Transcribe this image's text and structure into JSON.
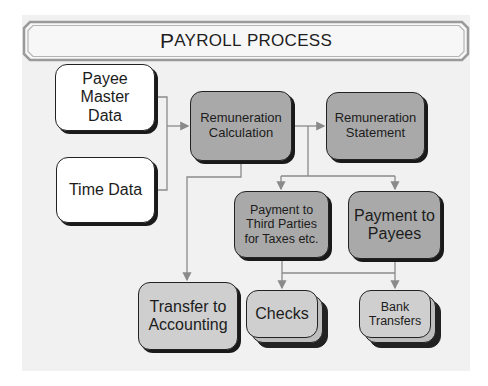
{
  "title_parts": {
    "first_cap": "P",
    "rest_first": "AYROLL",
    "word2": "PROCESS"
  },
  "colors": {
    "slide_bg": "#f1f1f1",
    "input_fill": "#ffffff",
    "process_fill": "#a9a9a9",
    "output_fill": "#cfcfcf",
    "border": "#222222",
    "connector": "#8a8a8a"
  },
  "nodes": {
    "payee_master_data": {
      "label": "Payee Master Data",
      "lines": [
        "Payee",
        "Master",
        "Data"
      ]
    },
    "time_data": {
      "label": "Time Data"
    },
    "remuneration_calculation": {
      "label": "Remuneration Calculation",
      "lines": [
        "Remuneration",
        "Calculation"
      ]
    },
    "remuneration_statement": {
      "label": "Remuneration Statement",
      "lines": [
        "Remuneration",
        "Statement"
      ]
    },
    "payment_third_parties": {
      "label": "Payment to Third Parties for Taxes etc.",
      "lines": [
        "Payment to",
        "Third Parties",
        "for Taxes etc."
      ]
    },
    "payment_payees": {
      "label": "Payment to Payees",
      "lines": [
        "Payment to",
        "Payees"
      ]
    },
    "transfer_accounting": {
      "label": "Transfer to Accounting",
      "lines": [
        "Transfer to",
        "Accounting"
      ]
    },
    "checks": {
      "label": "Checks"
    },
    "bank_transfers": {
      "label": "Bank Transfers",
      "lines": [
        "Bank",
        "Transfers"
      ]
    }
  },
  "edges": [
    {
      "from": "Payee Master Data",
      "to": "Remuneration Calculation"
    },
    {
      "from": "Time Data",
      "to": "Remuneration Calculation"
    },
    {
      "from": "Remuneration Calculation",
      "to": "Remuneration Statement"
    },
    {
      "from": "Remuneration Calculation",
      "to": "Payment to Third Parties for Taxes etc."
    },
    {
      "from": "Remuneration Calculation",
      "to": "Payment to Payees"
    },
    {
      "from": "Remuneration Calculation",
      "to": "Transfer to Accounting"
    },
    {
      "from": "Payment to Third Parties for Taxes etc.",
      "to": "Checks"
    },
    {
      "from": "Payment to Third Parties for Taxes etc.",
      "to": "Bank Transfers"
    },
    {
      "from": "Payment to Payees",
      "to": "Checks"
    },
    {
      "from": "Payment to Payees",
      "to": "Bank Transfers"
    }
  ]
}
